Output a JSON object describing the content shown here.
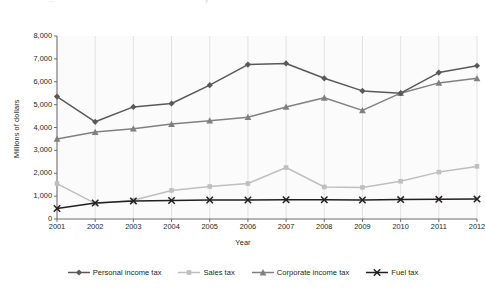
{
  "top_ghost": {
    "left_fragment": "...",
    "right_fragment": "y"
  },
  "chart_data": {
    "type": "line",
    "title": "",
    "xlabel": "Year",
    "ylabel": "Millions of dollars",
    "categories": [
      "2001",
      "2002",
      "2003",
      "2004",
      "2005",
      "2006",
      "2007",
      "2008",
      "2009",
      "2010",
      "2011",
      "2012"
    ],
    "x": [
      2001,
      2002,
      2003,
      2004,
      2005,
      2006,
      2007,
      2008,
      2009,
      2010,
      2011,
      2012
    ],
    "ylim": [
      0,
      8000
    ],
    "xlim": [
      2001,
      2012
    ],
    "yticks": [
      0,
      1000,
      2000,
      3000,
      4000,
      5000,
      6000,
      7000,
      8000
    ],
    "ytick_labels": [
      "0",
      "1,000",
      "2,000",
      "3,000",
      "4,000",
      "5,000",
      "6,000",
      "7,000",
      "8,000"
    ],
    "grid": "vertical",
    "legend_position": "bottom",
    "series": [
      {
        "name": "Personal income tax",
        "color": "#595959",
        "marker": "diamond",
        "values": [
          5350,
          4250,
          4900,
          5050,
          5850,
          6750,
          6800,
          6150,
          5600,
          5500,
          6400,
          6700
        ]
      },
      {
        "name": "Sales tax",
        "color": "#bfbfbf",
        "marker": "square",
        "values": [
          1550,
          680,
          820,
          1250,
          1420,
          1550,
          2250,
          1400,
          1380,
          1650,
          2050,
          2300
        ]
      },
      {
        "name": "Corporate income tax",
        "color": "#808080",
        "marker": "triangle",
        "values": [
          3500,
          3800,
          3950,
          4150,
          4300,
          4450,
          4900,
          5300,
          4750,
          5500,
          5950,
          6150
        ]
      },
      {
        "name": "Fuel tax",
        "color": "#231f20",
        "marker": "x",
        "values": [
          460,
          700,
          790,
          810,
          830,
          830,
          840,
          840,
          830,
          850,
          860,
          870
        ]
      }
    ]
  }
}
